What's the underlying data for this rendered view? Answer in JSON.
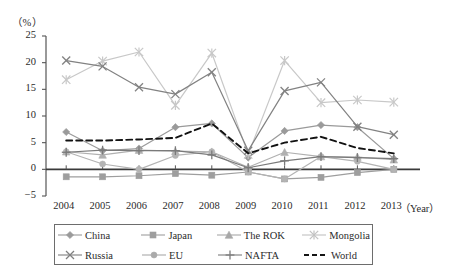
{
  "axis": {
    "unit_label": "（%）",
    "x_axis_title": "（Year）",
    "y_ticks": [
      "25",
      "20",
      "15",
      "10",
      "5",
      "0",
      "-5"
    ],
    "x_ticks": [
      "2004",
      "2005",
      "2006",
      "2007",
      "2008",
      "2009",
      "2010",
      "2011",
      "2012",
      "2013"
    ]
  },
  "legend": {
    "rows": [
      [
        {
          "label": "China",
          "marker": "diamond-marker",
          "color": "#9a9a9a"
        },
        {
          "label": "Japan",
          "marker": "square-marker",
          "color": "#9e9e9e"
        },
        {
          "label": "The ROK",
          "marker": "triangle-marker",
          "color": "#a8a8a8"
        },
        {
          "label": "Mongolia",
          "marker": "asterisk-marker",
          "color": "#c2c2c2"
        }
      ],
      [
        {
          "label": "Russia",
          "marker": "cross-x-marker",
          "color": "#808080"
        },
        {
          "label": "EU",
          "marker": "circle-marker",
          "color": "#aaaaaa"
        },
        {
          "label": "NAFTA",
          "marker": "plus-marker",
          "color": "#7d7d7d"
        },
        {
          "label": "World",
          "marker": "dashed-line",
          "color": "#151515"
        }
      ]
    ]
  },
  "chart_data": {
    "type": "line",
    "title": "",
    "xlabel": "（Year）",
    "ylabel": "（%）",
    "ylim": [
      -5,
      25
    ],
    "ytick_step": 5,
    "grid": false,
    "legend_position": "bottom",
    "categories": [
      "2004",
      "2005",
      "2006",
      "2007",
      "2008",
      "2009",
      "2010",
      "2011",
      "2012",
      "2013"
    ],
    "series": [
      {
        "name": "China",
        "marker": "diamond-marker",
        "color": "#9a9a9a",
        "dash": "none",
        "values": [
          7.0,
          3.5,
          3.9,
          7.9,
          8.6,
          2.2,
          7.2,
          8.3,
          7.9,
          2.0
        ]
      },
      {
        "name": "Japan",
        "marker": "square-marker",
        "color": "#9e9e9e",
        "dash": "none",
        "values": [
          -1.4,
          -1.4,
          -1.2,
          -0.8,
          -1.1,
          -0.5,
          -1.8,
          -1.5,
          -0.6,
          0.0
        ]
      },
      {
        "name": "The ROK",
        "marker": "triangle-marker",
        "color": "#b0b0b0",
        "dash": "none",
        "values": [
          3.3,
          2.7,
          3.6,
          3.4,
          3.3,
          0.4,
          3.2,
          2.4,
          2.3,
          1.8
        ]
      },
      {
        "name": "Mongolia",
        "marker": "asterisk-marker",
        "color": "#c8c8c8",
        "dash": "none",
        "values": [
          16.8,
          20.3,
          22.0,
          12.0,
          21.8,
          2.8,
          20.4,
          12.5,
          13.0,
          12.6
        ]
      },
      {
        "name": "Russia",
        "marker": "cross-x-marker",
        "color": "#828282",
        "dash": "none",
        "values": [
          20.4,
          19.3,
          15.4,
          14.1,
          18.2,
          3.5,
          14.7,
          16.3,
          8.0,
          6.5
        ]
      },
      {
        "name": "EU",
        "marker": "circle-marker",
        "color": "#b4b4b4",
        "dash": "none",
        "values": [
          3.3,
          1.0,
          0.0,
          2.6,
          3.3,
          -0.5,
          -1.8,
          2.4,
          1.5,
          0.0
        ]
      },
      {
        "name": "NAFTA",
        "marker": "plus-marker",
        "color": "#7a7a7a",
        "dash": "none",
        "values": [
          3.2,
          3.6,
          3.5,
          3.5,
          2.7,
          0.3,
          1.6,
          2.4,
          2.2,
          2.0
        ]
      },
      {
        "name": "World",
        "marker": "none",
        "color": "#121212",
        "dash": "6,4",
        "values": [
          5.4,
          5.4,
          5.6,
          5.9,
          8.6,
          3.0,
          5.0,
          6.1,
          4.0,
          3.0
        ]
      }
    ]
  }
}
